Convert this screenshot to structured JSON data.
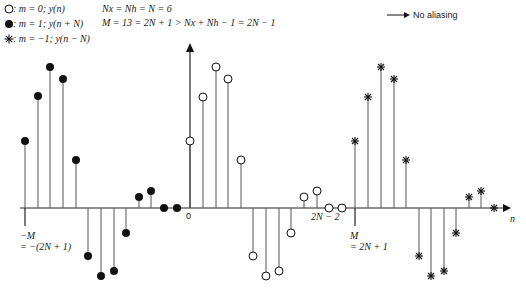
{
  "legend": {
    "items": [
      {
        "marker": "open-circle",
        "label": ": m = 0; y(n)"
      },
      {
        "marker": "filled-circle",
        "label": ": m = 1; y(n + N)"
      },
      {
        "marker": "asterisk",
        "label": ": m = −1; y(n − N)"
      }
    ]
  },
  "equations": {
    "line1": "Nx = Nh = N = 6",
    "line2": "M = 13 = 2N + 1 > Nx + Nh − 1 = 2N − 1",
    "arrow_text": "No aliasing"
  },
  "axis_labels": {
    "origin": "0",
    "neg_m_line1": "−M",
    "neg_m_line2": "= −(2N + 1)",
    "two_n_minus_2": "2N − 2",
    "m_line1": "M",
    "m_line2": "= 2N + 1",
    "n": "n"
  },
  "chart_data": {
    "type": "stem",
    "title": "",
    "xlabel": "n",
    "axis_y_pixel": 208,
    "series": [
      {
        "name": "m = 1; y(n + N)",
        "marker": "filled-circle",
        "x": [
          25,
          38,
          50,
          63,
          76,
          88,
          101,
          114,
          126,
          139,
          151,
          164,
          177
        ],
        "y": [
          141,
          96,
          67,
          79,
          160,
          256,
          276,
          271,
          233,
          197,
          191,
          208,
          208
        ]
      },
      {
        "name": "m = 0; y(n)",
        "marker": "open-circle",
        "x": [
          190,
          203,
          216,
          228,
          241,
          253,
          266,
          279,
          291,
          304,
          317,
          329,
          342
        ],
        "y": [
          141,
          97,
          67,
          79,
          160,
          256,
          276,
          271,
          233,
          197,
          191,
          208,
          208
        ]
      },
      {
        "name": "m = −1; y(n − N)",
        "marker": "asterisk",
        "x": [
          355,
          368,
          381,
          394,
          406,
          419,
          431,
          444,
          456,
          469,
          481,
          494
        ],
        "y": [
          141,
          97,
          67,
          79,
          160,
          256,
          276,
          271,
          233,
          197,
          191,
          208
        ]
      }
    ],
    "annotations": [
      "−M = −(2N + 1)",
      "0",
      "2N − 2",
      "M = 2N + 1",
      "n",
      "No aliasing"
    ]
  }
}
